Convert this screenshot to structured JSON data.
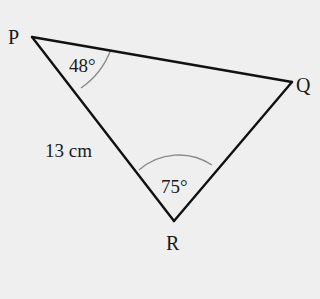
{
  "diagram": {
    "type": "triangle",
    "background": "#efefef",
    "line_color": "#111111",
    "arc_color": "#8a8a8a",
    "vertices": {
      "P": {
        "label": "P",
        "x": 32,
        "y": 37
      },
      "Q": {
        "label": "Q",
        "x": 292,
        "y": 82
      },
      "R": {
        "label": "R",
        "x": 174,
        "y": 221
      }
    },
    "angles": {
      "P": {
        "label": "48°",
        "value": 48
      },
      "R": {
        "label": "75°",
        "value": 75
      }
    },
    "sides": {
      "PR": {
        "label": "13 cm",
        "length": 13,
        "unit": "cm"
      }
    }
  }
}
